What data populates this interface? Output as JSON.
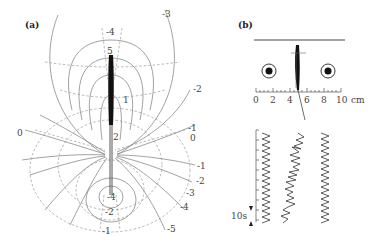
{
  "figure": {
    "panel_a": {
      "label": "(a)",
      "contour_labels_top": [
        "-4",
        "5",
        "-3",
        "-2",
        "1"
      ],
      "contour_labels_mid": [
        "2",
        "-1",
        "0",
        "0"
      ],
      "contour_labels_right": [
        "-1",
        "-2",
        "-3",
        "-4",
        "-5"
      ],
      "contour_labels_bottom": [
        "-4",
        "-2",
        "-1"
      ]
    },
    "panel_b": {
      "label": "(b)",
      "ruler": {
        "ticks": [
          "0",
          "2",
          "4",
          "6",
          "8",
          "10"
        ],
        "unit": "cm"
      },
      "time_scale_label": "10s",
      "traces": [
        "left-regular",
        "middle-irregular",
        "right-regular"
      ]
    }
  }
}
